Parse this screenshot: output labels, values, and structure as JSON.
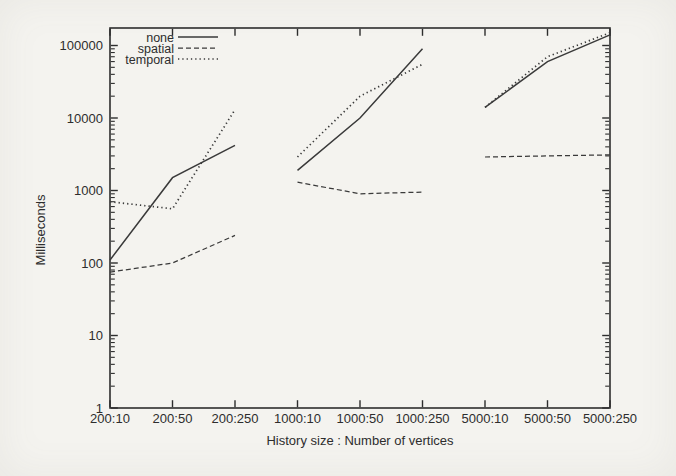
{
  "figure": {
    "background_color": "#f4f3ef",
    "ink_color": "#2d2d2d",
    "line_color": "#3a3a3a"
  },
  "chart_data": {
    "type": "line",
    "title": "",
    "xlabel": "History size : Number of vertices",
    "ylabel": "Milliseconds",
    "categories": [
      "200:10",
      "200:50",
      "200:250",
      "1000:10",
      "1000:50",
      "1000:250",
      "5000:10",
      "5000:50",
      "5000:250"
    ],
    "group_size": 3,
    "segmented_note": "each series is drawn as 3 disconnected segments, one per history-size group",
    "y_axis": {
      "scale": "log",
      "min": 1,
      "max": 175000,
      "major_ticks": [
        1,
        10,
        100,
        1000,
        10000,
        100000
      ],
      "major_tick_labels": [
        "1",
        "10",
        "100",
        "1000",
        "10000",
        "100000"
      ],
      "minor_ticks": "2-9 within each decade, unlabeled"
    },
    "series": [
      {
        "name": "none",
        "line_style": "solid",
        "values": [
          110,
          1500,
          4200,
          1900,
          10000,
          90000,
          14000,
          60000,
          140000
        ]
      },
      {
        "name": "spatial",
        "line_style": "dashed",
        "values": [
          75,
          100,
          240,
          1300,
          900,
          950,
          2900,
          3000,
          3100
        ]
      },
      {
        "name": "temporal",
        "line_style": "dotted",
        "values": [
          700,
          560,
          13000,
          2900,
          20000,
          55000,
          14000,
          70000,
          150000
        ]
      }
    ],
    "legend": {
      "position": "top-left-inside",
      "entries": [
        "none",
        "spatial",
        "temporal"
      ]
    },
    "grid": false
  }
}
